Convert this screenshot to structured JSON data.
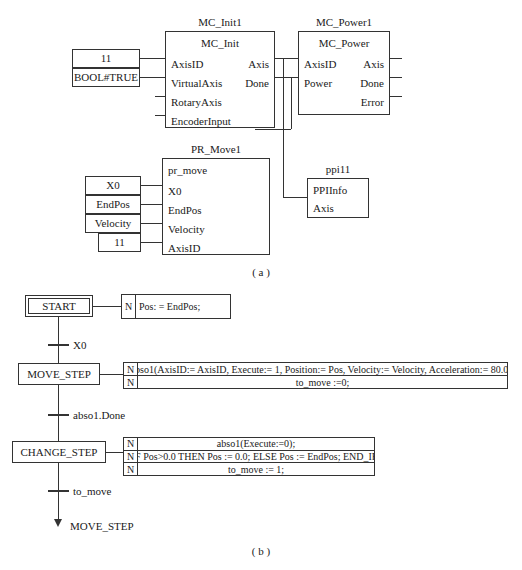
{
  "figure": {
    "caption_a": "( a )",
    "caption_b": "( b )"
  },
  "part_a": {
    "blocks": [
      {
        "instance": "MC_Init1",
        "type": "MC_Init",
        "inputs": [
          "AxisID",
          "VirtualAxis",
          "RotaryAxis",
          "EncoderInput"
        ],
        "outputs": [
          "Axis",
          "Done"
        ]
      },
      {
        "instance": "MC_Power1",
        "type": "MC_Power",
        "inputs": [
          "AxisID",
          "Power"
        ],
        "outputs": [
          "Axis",
          "Done",
          "Error"
        ]
      },
      {
        "instance": "PR_Move1",
        "type": "pr_move",
        "inputs": [
          "X0",
          "EndPos",
          "Velocity",
          "AxisID"
        ],
        "outputs": []
      },
      {
        "instance": "ppi11",
        "type": "PPIInfo",
        "inputs": [
          "Axis"
        ],
        "outputs": []
      }
    ],
    "literals": {
      "init_axis_id": "11",
      "init_virtual_axis": "BOOL#TRUE",
      "move_x0": "X0",
      "move_endpos": "EndPos",
      "move_velocity": "Velocity",
      "move_axis_id": "11"
    }
  },
  "part_b": {
    "steps": [
      {
        "name": "START",
        "initial": true,
        "actions": [
          {
            "qualifier": "N",
            "text": "Pos: = EndPos;"
          }
        ]
      },
      {
        "name": "MOVE_STEP",
        "initial": false,
        "actions": [
          {
            "qualifier": "N",
            "text": "abso1(AxisID:= AxisID, Execute:= 1, Position:= Pos, Velocity:= Velocity, Acceleration:= 80.0);"
          },
          {
            "qualifier": "N",
            "text": "to_move :=0;"
          }
        ]
      },
      {
        "name": "CHANGE_STEP",
        "initial": false,
        "actions": [
          {
            "qualifier": "N",
            "text": "abso1(Execute:=0);"
          },
          {
            "qualifier": "N",
            "text": "IF Pos>0.0 THEN Pos := 0.0; ELSE Pos := EndPos; END_IF;"
          },
          {
            "qualifier": "N",
            "text": "to_move := 1;"
          }
        ]
      }
    ],
    "transitions": [
      {
        "label": "X0"
      },
      {
        "label": "abso1.Done"
      },
      {
        "label": "to_move"
      }
    ],
    "jump_target": "MOVE_STEP"
  }
}
